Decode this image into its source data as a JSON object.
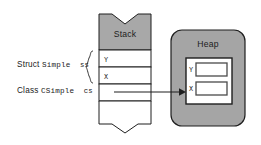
{
  "diagram": {
    "title_stack": "Stack",
    "title_heap": "Heap",
    "colors": {
      "gray_fill": "#a8a8a8",
      "heap_fill": "#a5a5a5",
      "white_fill": "#ffffff",
      "stroke": "#1f1f1f",
      "text": "#1a1a1a"
    }
  },
  "labels": {
    "struct": {
      "keyword": "Struct",
      "type": "Simple",
      "variable": "ss"
    },
    "class": {
      "keyword": "Class",
      "type": "CSimple",
      "variable": "cs"
    }
  },
  "stack": {
    "title": "Stack",
    "cells": [
      {
        "name": "stack-cell-y",
        "text": "Y"
      },
      {
        "name": "stack-cell-x",
        "text": "X"
      },
      {
        "name": "stack-cell-pointer",
        "text": ""
      },
      {
        "name": "stack-cell-empty",
        "text": ""
      }
    ]
  },
  "heap": {
    "title": "Heap",
    "object_fields": [
      {
        "name": "heap-field-y",
        "text": "Y",
        "value": ""
      },
      {
        "name": "heap-field-x",
        "text": "X",
        "value": ""
      }
    ]
  },
  "connector": {
    "name": "pointer-arrow",
    "from": "stack-cell-pointer",
    "to": "heap-object"
  }
}
